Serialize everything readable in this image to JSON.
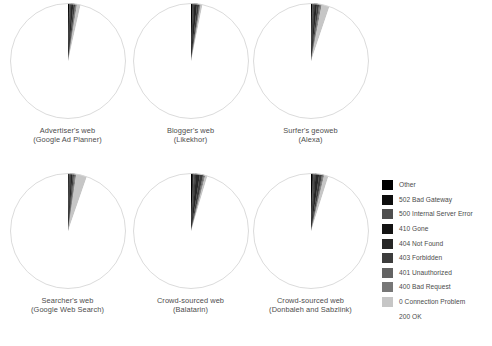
{
  "figure": {
    "background": "#ffffff",
    "outline_color": "#d7d7d7"
  },
  "legend": {
    "position": "right",
    "entries": [
      {
        "label": "Other",
        "color": "#000000"
      },
      {
        "label": "502 Bad Gateway",
        "color": "#0d0d0d"
      },
      {
        "label": "500 Internal Server Error",
        "color": "#4f4f4f"
      },
      {
        "label": "410 Gone",
        "color": "#131313"
      },
      {
        "label": "404 Not Found",
        "color": "#262626"
      },
      {
        "label": "403 Forbidden",
        "color": "#3d3d3d"
      },
      {
        "label": "401 Unauthorized",
        "color": "#636363"
      },
      {
        "label": "400 Bad Request",
        "color": "#777777"
      },
      {
        "label": "0 Connection Problem",
        "color": "#c6c6c6"
      },
      {
        "label": "200 OK",
        "color": "#ffffff"
      }
    ]
  },
  "chart_data": {
    "type": "pie",
    "title": "",
    "legend_position": "right",
    "categories": [
      "Other",
      "502 Bad Gateway",
      "500 Internal Server Error",
      "410 Gone",
      "404 Not Found",
      "403 Forbidden",
      "401 Unauthorized",
      "400 Bad Request",
      "0 Connection Problem",
      "200 OK"
    ],
    "colors": [
      "#000000",
      "#0d0d0d",
      "#4f4f4f",
      "#131313",
      "#262626",
      "#3d3d3d",
      "#636363",
      "#777777",
      "#c6c6c6",
      "#ffffff"
    ],
    "units": "percent",
    "charts": [
      {
        "id": "advertisers-web",
        "title_line1": "Advertiser's web",
        "title_line2": "(Google Ad Planner)",
        "values": [
          0.3,
          0.1,
          0.4,
          0.1,
          0.6,
          0.5,
          0.2,
          0.3,
          1.0,
          96.5
        ]
      },
      {
        "id": "bloggers-web",
        "title_line1": "Blogger's web",
        "title_line2": "(Likekhor)",
        "values": [
          0.4,
          0.1,
          0.3,
          0.1,
          0.8,
          0.6,
          0.2,
          0.2,
          0.5,
          96.8
        ]
      },
      {
        "id": "surfers-geoweb",
        "title_line1": "Surfer's geoweb",
        "title_line2": "(Alexa)",
        "values": [
          0.3,
          0.1,
          0.5,
          0.1,
          0.7,
          0.6,
          0.3,
          0.4,
          2.2,
          94.8
        ]
      },
      {
        "id": "searchers-web",
        "title_line1": "Searcher's web",
        "title_line2": "(Google Web Search)",
        "values": [
          0.2,
          0.1,
          0.4,
          0.1,
          0.5,
          0.4,
          0.3,
          0.3,
          3.0,
          94.7
        ]
      },
      {
        "id": "crowd-sourced-balatarin",
        "title_line1": "Crowd-sourced web",
        "title_line2": "(Balatarin)",
        "values": [
          0.5,
          0.2,
          0.5,
          0.2,
          1.1,
          0.9,
          0.3,
          0.3,
          0.6,
          95.4
        ]
      },
      {
        "id": "crowd-sourced-donbaleh",
        "title_line1": "Crowd-sourced web",
        "title_line2": "(Donbaleh and Sabzlink)",
        "values": [
          0.4,
          0.2,
          0.5,
          0.2,
          1.0,
          0.8,
          0.3,
          0.3,
          1.2,
          95.1
        ]
      }
    ]
  }
}
